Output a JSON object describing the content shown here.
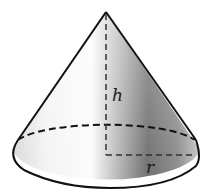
{
  "figure": {
    "type": "cone",
    "labels": {
      "height": "h",
      "radius": "r"
    },
    "colors": {
      "outline": "#111111",
      "shade_light": "#ffffff",
      "shade_dark": "#6e6e6e",
      "background": "#ffffff"
    }
  }
}
